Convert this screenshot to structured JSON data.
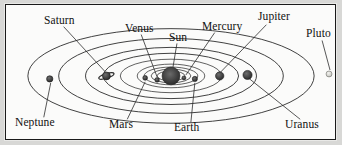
{
  "figure": {
    "frame_color": "#1a1a1a",
    "background_color": "#fbfbfa",
    "paper_color": "#d8d8d6",
    "orbit_color": "#2b2b2b",
    "leader_color": "#2b2b2b",
    "sun_color": "#3a3a3a",
    "planet_color": "#3b3b3b",
    "pluto_color": "#c9c9c4"
  },
  "labels": [
    {
      "id": "saturn",
      "text": "Saturn",
      "x": 38,
      "y": 16,
      "anchor": "start"
    },
    {
      "id": "venus",
      "text": "Venus",
      "x": 119,
      "y": 24,
      "anchor": "start"
    },
    {
      "id": "mercury",
      "text": "Mercury",
      "x": 198,
      "y": 22,
      "anchor": "start"
    },
    {
      "id": "jupiter",
      "text": "Jupiter",
      "x": 253,
      "y": 12,
      "anchor": "start"
    },
    {
      "id": "sun",
      "text": "Sun",
      "x": 164,
      "y": 33,
      "anchor": "start"
    },
    {
      "id": "pluto",
      "text": "Pluto",
      "x": 304,
      "y": 30,
      "anchor": "start"
    },
    {
      "id": "neptune",
      "text": "Neptune",
      "x": 12,
      "y": 120,
      "anchor": "start"
    },
    {
      "id": "mars",
      "text": "Mars",
      "x": 106,
      "y": 122,
      "anchor": "start"
    },
    {
      "id": "earth",
      "text": "Earth",
      "x": 172,
      "y": 125,
      "anchor": "start"
    },
    {
      "id": "uranus",
      "text": "Uranus",
      "x": 283,
      "y": 122,
      "anchor": "start"
    }
  ],
  "bodies": [
    {
      "id": "sun",
      "name": "Sun",
      "cx": 166,
      "cy": 72,
      "r": 9.0,
      "kind": "sun"
    },
    {
      "id": "mercury",
      "name": "Mercury",
      "cx": 179,
      "cy": 74,
      "r": 2.0,
      "kind": "planet"
    },
    {
      "id": "venus",
      "name": "Venus",
      "cx": 152,
      "cy": 76,
      "r": 2.3,
      "kind": "planet"
    },
    {
      "id": "earth",
      "name": "Earth",
      "cx": 190,
      "cy": 75,
      "r": 2.6,
      "kind": "planet"
    },
    {
      "id": "mars",
      "name": "Mars",
      "cx": 140,
      "cy": 74,
      "r": 2.4,
      "kind": "planet"
    },
    {
      "id": "jupiter",
      "name": "Jupiter",
      "cx": 215,
      "cy": 72,
      "r": 4.2,
      "kind": "planet"
    },
    {
      "id": "saturn",
      "name": "Saturn",
      "cx": 101,
      "cy": 72,
      "r": 4.0,
      "kind": "ringed"
    },
    {
      "id": "uranus",
      "name": "Uranus",
      "cx": 243,
      "cy": 71,
      "r": 4.6,
      "kind": "planet"
    },
    {
      "id": "neptune",
      "name": "Neptune",
      "cx": 44,
      "cy": 75,
      "r": 3.2,
      "kind": "planet"
    },
    {
      "id": "pluto",
      "name": "Pluto",
      "cx": 325,
      "cy": 70,
      "r": 3.0,
      "kind": "faint"
    }
  ],
  "orbits": [
    {
      "id": "orbit-mercury",
      "planet": "Mercury",
      "rx": 14,
      "ry": 5
    },
    {
      "id": "orbit-venus",
      "planet": "Venus",
      "rx": 20,
      "ry": 7
    },
    {
      "id": "orbit-earth",
      "planet": "Earth",
      "rx": 27,
      "ry": 9
    },
    {
      "id": "orbit-mars",
      "planet": "Mars",
      "rx": 34,
      "ry": 12
    },
    {
      "id": "orbit-jupiter",
      "planet": "Jupiter",
      "rx": 51,
      "ry": 17
    },
    {
      "id": "orbit-saturn",
      "planet": "Saturn",
      "rx": 68,
      "ry": 23
    },
    {
      "id": "orbit-uranus",
      "planet": "Uranus",
      "rx": 86,
      "ry": 29
    },
    {
      "id": "orbit-neptune",
      "planet": "Neptune",
      "rx": 113,
      "ry": 38
    },
    {
      "id": "orbit-pluto",
      "planet": "Pluto",
      "rx": 144,
      "ry": 48
    }
  ],
  "leaders": [
    {
      "id": "leader-saturn",
      "x1": 58,
      "y1": 22,
      "x2": 100,
      "y2": 68
    },
    {
      "id": "leader-venus",
      "x1": 136,
      "y1": 30,
      "x2": 152,
      "y2": 73
    },
    {
      "id": "leader-mercury",
      "x1": 210,
      "y1": 28,
      "x2": 181,
      "y2": 71
    },
    {
      "id": "leader-jupiter",
      "x1": 262,
      "y1": 20,
      "x2": 216,
      "y2": 68
    },
    {
      "id": "leader-sun",
      "x1": 172,
      "y1": 39,
      "x2": 168,
      "y2": 63
    },
    {
      "id": "leader-pluto",
      "x1": 318,
      "y1": 36,
      "x2": 326,
      "y2": 66
    },
    {
      "id": "leader-neptune",
      "x1": 38,
      "y1": 114,
      "x2": 45,
      "y2": 79
    },
    {
      "id": "leader-mars",
      "x1": 122,
      "y1": 116,
      "x2": 140,
      "y2": 78
    },
    {
      "id": "leader-earth",
      "x1": 186,
      "y1": 119,
      "x2": 190,
      "y2": 79
    },
    {
      "id": "leader-uranus",
      "x1": 296,
      "y1": 116,
      "x2": 245,
      "y2": 75
    }
  ]
}
